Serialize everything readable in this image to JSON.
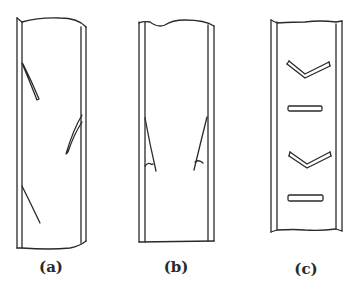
{
  "panels": [
    {
      "id": "a",
      "label": "(a)",
      "description": "Tube with inclined cracks on alternating walls"
    },
    {
      "id": "b",
      "label": "(b)",
      "description": "Tube with symmetric longitudinal wall cracks with hooked ends"
    },
    {
      "id": "c",
      "label": "(c)",
      "description": "Tube with chevron and transverse bar marks"
    }
  ],
  "colors": {
    "stroke": "#2a2a2a",
    "background": "#ffffff"
  }
}
